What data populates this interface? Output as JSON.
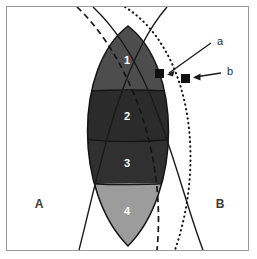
{
  "figure": {
    "background_color": "#ffffff",
    "frame_color": "#9a9a9a"
  },
  "set_labels": [
    {
      "text": "A",
      "x": 32,
      "y": 201,
      "description": "left circle set label"
    },
    {
      "text": "B",
      "x": 213,
      "y": 201,
      "description": "right circle set label"
    }
  ],
  "lens_regions": [
    {
      "label": "1",
      "x": 120,
      "y": 57,
      "fill": "#4d4d4d",
      "description": "top band of lens"
    },
    {
      "label": "2",
      "x": 120,
      "y": 113,
      "fill": "#2b2b2b",
      "description": "upper middle band of lens"
    },
    {
      "label": "3",
      "x": 120,
      "y": 160,
      "fill": "#303030",
      "description": "lower middle band of lens"
    },
    {
      "label": "4",
      "x": 120,
      "y": 208,
      "fill": "#9c9c9c",
      "description": "bottom band of lens"
    }
  ],
  "markers": [
    {
      "id": "a",
      "x": 158,
      "y": 71,
      "size": 9,
      "fill": "#101010",
      "inside_lens": true
    },
    {
      "id": "b",
      "x": 184,
      "y": 76,
      "size": 9,
      "fill": "#101010",
      "inside_lens": false
    }
  ],
  "marker_labels": [
    {
      "text": "a",
      "x": 213,
      "y": 41
    },
    {
      "text": "b",
      "x": 223,
      "y": 71
    }
  ],
  "curves": [
    {
      "name": "circle-A-boundary",
      "style": "solid",
      "color": "#1a1a1a",
      "width": 1.4
    },
    {
      "name": "circle-B-boundary",
      "style": "solid",
      "color": "#1a1a1a",
      "width": 1.4
    },
    {
      "name": "dashed-contour",
      "style": "dashed",
      "color": "#1a1a1a",
      "width": 1.6
    },
    {
      "name": "dotted-contour",
      "style": "dotted",
      "color": "#1a1a1a",
      "width": 1.8
    }
  ],
  "band_dividers": [
    {
      "name": "divider-1-2",
      "y": 84
    },
    {
      "name": "divider-2-3",
      "y": 133
    },
    {
      "name": "divider-3-4",
      "y": 176
    }
  ]
}
